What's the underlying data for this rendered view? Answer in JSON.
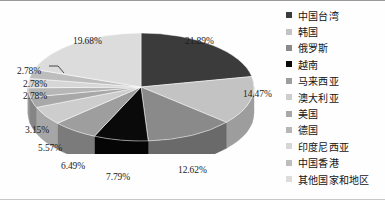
{
  "chart_data": {
    "type": "pie",
    "title": "",
    "subtitle": "",
    "xlabel": "",
    "ylabel": "",
    "legend_position": "right",
    "grid": false,
    "three_d": true,
    "value_suffix": "%",
    "categories": [
      "中国台湾",
      "韩国",
      "俄罗斯",
      "越南",
      "马来西亚",
      "澳大利亚",
      "美国",
      "德国",
      "印度尼西亚",
      "中国香港",
      "其他国家和地区"
    ],
    "values": [
      21.89,
      14.47,
      12.62,
      7.79,
      6.49,
      5.57,
      3.15,
      2.78,
      2.78,
      2.78,
      19.68
    ],
    "labels": [
      "21.89%",
      "14.47%",
      "12.62%",
      "7.79%",
      "6.49%",
      "5.57%",
      "3.15%",
      "2.78%",
      "2.78%",
      "2.78%",
      "19.68%"
    ],
    "colors": [
      "#3b3b3b",
      "#c3c3c3",
      "#8a8a8a",
      "#0a0a0a",
      "#9e9e9e",
      "#cdcdcd",
      "#a8a8a8",
      "#b6b6b6",
      "#d6d6d6",
      "#bdbdbd",
      "#dcdcdc"
    ],
    "side_colors": [
      "#242424",
      "#9d9d9d",
      "#6a6a6a",
      "#050505",
      "#7b7b7b",
      "#a6a6a6",
      "#858585",
      "#919191",
      "#ababab",
      "#969696",
      "#b0b0b0"
    ],
    "slices": [
      {
        "label": "中国台湾",
        "value": 21.89,
        "text": "21.89%",
        "color": "#3b3b3b"
      },
      {
        "label": "韩国",
        "value": 14.47,
        "text": "14.47%",
        "color": "#c3c3c3"
      },
      {
        "label": "俄罗斯",
        "value": 12.62,
        "text": "12.62%",
        "color": "#8a8a8a"
      },
      {
        "label": "越南",
        "value": 7.79,
        "text": "7.79%",
        "color": "#0a0a0a"
      },
      {
        "label": "马来西亚",
        "value": 6.49,
        "text": "6.49%",
        "color": "#9e9e9e"
      },
      {
        "label": "澳大利亚",
        "value": 5.57,
        "text": "5.57%",
        "color": "#cdcdcd"
      },
      {
        "label": "美国",
        "value": 3.15,
        "text": "3.15%",
        "color": "#a8a8a8"
      },
      {
        "label": "德国",
        "value": 2.78,
        "text": "2.78%",
        "color": "#b6b6b6"
      },
      {
        "label": "印度尼西亚",
        "value": 2.78,
        "text": "2.78%",
        "color": "#d6d6d6"
      },
      {
        "label": "中国香港",
        "value": 2.78,
        "text": "2.78%",
        "color": "#bdbdbd"
      },
      {
        "label": "其他国家和地区",
        "value": 19.68,
        "text": "19.68%",
        "color": "#dcdcdc"
      }
    ]
  },
  "legend": {
    "items": [
      {
        "label": "中国台湾",
        "color": "#3b3b3b"
      },
      {
        "label": "韩国",
        "color": "#c3c3c3"
      },
      {
        "label": "俄罗斯",
        "color": "#8a8a8a"
      },
      {
        "label": "越南",
        "color": "#0a0a0a"
      },
      {
        "label": "马来西亚",
        "color": "#9e9e9e"
      },
      {
        "label": "澳大利亚",
        "color": "#cdcdcd"
      },
      {
        "label": "美国",
        "color": "#a8a8a8"
      },
      {
        "label": "德国",
        "color": "#b6b6b6"
      },
      {
        "label": "印度尼西亚",
        "color": "#d6d6d6"
      },
      {
        "label": "中国香港",
        "color": "#bdbdbd"
      },
      {
        "label": "其他国家和地区",
        "color": "#dcdcdc"
      }
    ]
  },
  "pct_labels": [
    {
      "name": "pct-label-taiwan",
      "text": "21.89%",
      "x": 185,
      "y": 33
    },
    {
      "name": "pct-label-korea",
      "text": "14.47%",
      "x": 243,
      "y": 86
    },
    {
      "name": "pct-label-russia",
      "text": "12.62%",
      "x": 178,
      "y": 162
    },
    {
      "name": "pct-label-vietnam",
      "text": "7.79%",
      "x": 106,
      "y": 169
    },
    {
      "name": "pct-label-malaysia",
      "text": "6.49%",
      "x": 61,
      "y": 158
    },
    {
      "name": "pct-label-australia",
      "text": "5.57%",
      "x": 38,
      "y": 140
    },
    {
      "name": "pct-label-usa",
      "text": "3.15%",
      "x": 25,
      "y": 122
    },
    {
      "name": "pct-label-germany",
      "text": "2.78%",
      "x": 23,
      "y": 88
    },
    {
      "name": "pct-label-indonesia",
      "text": "2.78%",
      "x": 23,
      "y": 76
    },
    {
      "name": "pct-label-hongkong",
      "text": "2.78%",
      "x": 17,
      "y": 63
    },
    {
      "name": "pct-label-others",
      "text": "19.68%",
      "x": 73,
      "y": 33
    }
  ]
}
